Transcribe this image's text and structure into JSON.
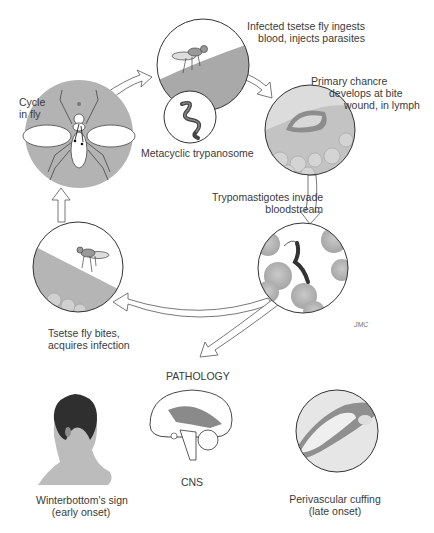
{
  "cycle": {
    "fly_cycle": {
      "line1": "Cycle",
      "line2": "in fly"
    },
    "step_ingest": {
      "line1": "Infected tsetse fly ingests",
      "line2": "blood, injects parasites"
    },
    "metacyclic": {
      "label": "Metacyclic trypanosome"
    },
    "step_chancre": {
      "line1": "Primary chancre",
      "line2": "develops at bite",
      "line3": "wound, in lymph"
    },
    "step_bloodstream": {
      "line1": "Trypomastigotes invade",
      "line2": "bloodstream"
    },
    "step_bite": {
      "line1": "Tsetse fly bites,",
      "line2": "acquires infection"
    }
  },
  "pathology": {
    "heading": "PATHOLOGY",
    "items": [
      {
        "line1": "Winterbottom's sign",
        "line2": "(early onset)"
      },
      {
        "line1": "CNS"
      },
      {
        "line1": "Perivascular cuffing",
        "line2": "(late onset)"
      }
    ]
  },
  "signature": "JMC",
  "colors": {
    "circle_fill": "#b8b8b8",
    "skin": "#c9c9c9",
    "outline": "#333333",
    "arrow_fill": "#ffffff",
    "rbc": "#bdbdbd",
    "parasite": "#444444"
  }
}
